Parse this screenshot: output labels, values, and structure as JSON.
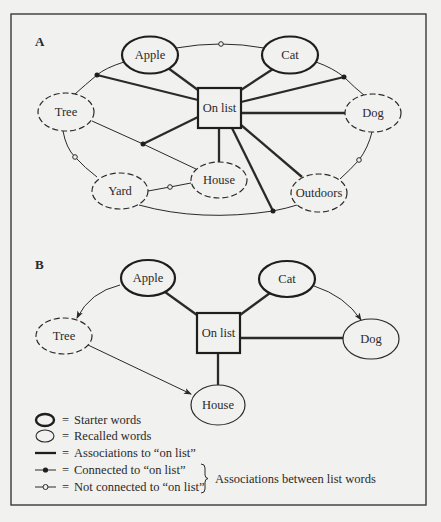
{
  "panels": {
    "A": {
      "label": "A",
      "center": "On list",
      "starter_words": [
        "Apple",
        "Cat"
      ],
      "recalled_words": [
        "Tree",
        "Dog",
        "Yard",
        "House",
        "Outdoors"
      ],
      "nodes": {
        "apple": "Apple",
        "cat": "Cat",
        "tree": "Tree",
        "dog": "Dog",
        "yard": "Yard",
        "house": "House",
        "outdoors": "Outdoors",
        "onlist": "On list"
      }
    },
    "B": {
      "label": "B",
      "center": "On list",
      "starter_words": [
        "Apple",
        "Cat"
      ],
      "recalled_words": [
        "Tree",
        "Dog",
        "House"
      ],
      "nodes": {
        "apple": "Apple",
        "cat": "Cat",
        "tree": "Tree",
        "dog": "Dog",
        "house": "House",
        "onlist": "On list"
      }
    }
  },
  "legend": {
    "starter": {
      "eq": "=",
      "text": "Starter words"
    },
    "recalled": {
      "eq": "=",
      "text": "Recalled words"
    },
    "assoc_on_list": {
      "eq": "=",
      "text": "Associations to “on list”"
    },
    "connected": {
      "eq": "=",
      "text": "Connected to “on list”"
    },
    "not_connected": {
      "eq": "=",
      "text": "Not connected to “on list”"
    },
    "brace_label": "Associations between list words"
  },
  "colors": {
    "background": "#f1f1ef",
    "ink": "#2a2a2a",
    "frame": "#3a3a3a"
  }
}
